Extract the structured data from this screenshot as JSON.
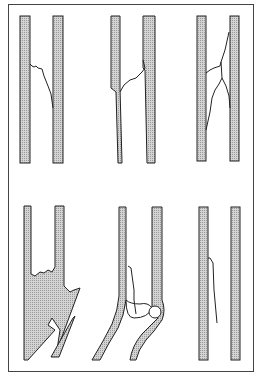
{
  "diagram": {
    "layout": "2 rows x 3 columns",
    "panels": [
      {
        "id": "transverse-serrated",
        "row": 1,
        "col": 1
      },
      {
        "id": "oblique",
        "row": 1,
        "col": 2
      },
      {
        "id": "comminuted-butterfly",
        "row": 1,
        "col": 3
      },
      {
        "id": "open-displaced",
        "row": 2,
        "col": 1
      },
      {
        "id": "joint-articular",
        "row": 2,
        "col": 2
      },
      {
        "id": "greenstick-fissure",
        "row": 2,
        "col": 3
      }
    ],
    "colors": {
      "frame": "#444444",
      "bone_fill": "#c8c8c8",
      "outline": "#222222",
      "background": "#ffffff"
    }
  }
}
